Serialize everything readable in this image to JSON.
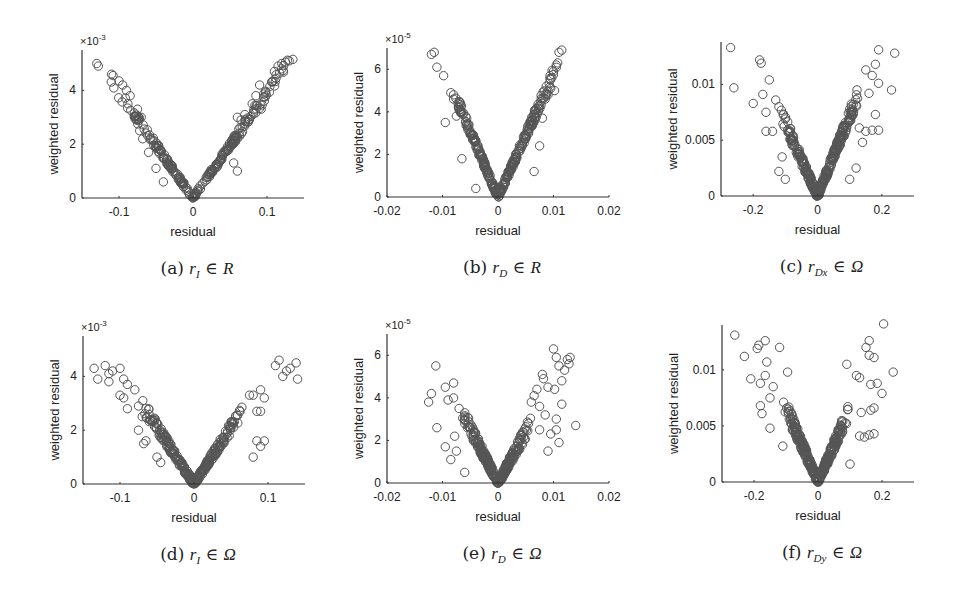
{
  "figure": {
    "marker_color": "#555555",
    "axis_color": "#333333",
    "text_color": "#222222"
  },
  "chart_data": [
    {
      "id": "a",
      "type": "scatter",
      "caption_prefix": "(a)",
      "caption_var": "r",
      "caption_sub": "I",
      "caption_set": "R",
      "xlabel": "residual",
      "ylabel": "weighted residual",
      "y_exponent": "×10",
      "y_exponent_power": "-3",
      "xlim": [
        -0.15,
        0.15
      ],
      "ylim": [
        0,
        5.5
      ],
      "xticks": [
        -0.1,
        0,
        0.1
      ],
      "xtick_labels": [
        "-0.1",
        "0",
        "0.1"
      ],
      "yticks": [
        0,
        2,
        4
      ],
      "ytick_labels": [
        "0",
        "2",
        "4"
      ],
      "box": {
        "left": 82,
        "top": 50,
        "right": 304,
        "bottom": 198
      },
      "band": {
        "slope_left": 39,
        "slope_right": 39,
        "spread": 0.35,
        "xmin": -0.12,
        "xmax": 0.135,
        "n": 260,
        "curve": 0.15
      },
      "points": [
        [
          -0.13,
          5.0
        ],
        [
          -0.128,
          4.9
        ],
        [
          -0.11,
          4.6
        ],
        [
          -0.108,
          4.55
        ],
        [
          -0.1,
          4.35
        ],
        [
          -0.095,
          4.2
        ],
        [
          -0.09,
          4.0
        ],
        [
          -0.085,
          3.8
        ],
        [
          -0.088,
          3.5
        ],
        [
          -0.075,
          3.3
        ],
        [
          -0.07,
          3.0
        ],
        [
          -0.072,
          2.5
        ],
        [
          -0.068,
          2.2
        ],
        [
          -0.06,
          1.7
        ],
        [
          -0.05,
          1.1
        ],
        [
          -0.04,
          0.6
        ],
        [
          0.06,
          3.0
        ],
        [
          0.065,
          2.9
        ],
        [
          0.07,
          3.1
        ],
        [
          0.08,
          3.5
        ],
        [
          0.085,
          3.8
        ],
        [
          0.09,
          4.2
        ],
        [
          0.092,
          3.3
        ],
        [
          0.06,
          1.0
        ],
        [
          0.055,
          1.3
        ],
        [
          0.11,
          4.7
        ],
        [
          0.115,
          4.9
        ],
        [
          0.12,
          5.0
        ],
        [
          0.125,
          5.05
        ],
        [
          0.13,
          5.1
        ],
        [
          0.135,
          5.15
        ]
      ]
    },
    {
      "id": "b",
      "type": "scatter",
      "caption_prefix": "(b)",
      "caption_var": "r",
      "caption_sub": "D",
      "caption_set": "R",
      "xlabel": "residual",
      "ylabel": "weighted residual",
      "y_exponent": "×10",
      "y_exponent_power": "-5",
      "xlim": [
        -0.02,
        0.02
      ],
      "ylim": [
        0,
        7
      ],
      "xticks": [
        -0.02,
        -0.01,
        0,
        0.01,
        0.02
      ],
      "xtick_labels": [
        "-0.02",
        "-0.01",
        "0",
        "0.01",
        "0.02"
      ],
      "yticks": [
        0,
        2,
        4,
        6
      ],
      "ytick_labels": [
        "0",
        "2",
        "4",
        "6"
      ],
      "box": {
        "left": 387,
        "top": 48,
        "right": 609,
        "bottom": 197
      },
      "band": {
        "slope_left": 620,
        "slope_right": 580,
        "spread": 0.5,
        "xmin": -0.0085,
        "xmax": 0.0115,
        "n": 300,
        "curve": 0.1
      },
      "points": [
        [
          -0.012,
          6.7
        ],
        [
          -0.0115,
          6.8
        ],
        [
          -0.011,
          6.1
        ],
        [
          -0.0098,
          5.7
        ],
        [
          -0.0095,
          3.5
        ],
        [
          -0.0085,
          4.9
        ],
        [
          -0.008,
          4.8
        ],
        [
          -0.008,
          4.6
        ],
        [
          -0.0075,
          3.8
        ],
        [
          -0.0065,
          1.8
        ],
        [
          -0.004,
          0.4
        ],
        [
          0.0065,
          1.2
        ],
        [
          0.0075,
          2.4
        ],
        [
          0.008,
          3.7
        ],
        [
          0.0085,
          4.6
        ],
        [
          0.009,
          4.8
        ],
        [
          0.0095,
          5.1
        ],
        [
          0.01,
          5.9
        ],
        [
          0.0105,
          6.2
        ],
        [
          0.011,
          6.8
        ],
        [
          0.0115,
          6.9
        ],
        [
          0.0102,
          5.0
        ]
      ]
    },
    {
      "id": "c",
      "type": "scatter",
      "caption_prefix": "(c)",
      "caption_var": "r",
      "caption_sub": "Dx",
      "caption_set": "Ω",
      "xlabel": "residual",
      "ylabel": "weighted residual",
      "y_exponent": "",
      "y_exponent_power": "",
      "xlim": [
        -0.3,
        0.3
      ],
      "ylim": [
        0,
        0.0138
      ],
      "xticks": [
        -0.2,
        0,
        0.2
      ],
      "xtick_labels": [
        "-0.2",
        "0",
        "0.2"
      ],
      "yticks": [
        0,
        0.005,
        0.01
      ],
      "ytick_labels": [
        "0",
        "0.005",
        "0.01"
      ],
      "box": {
        "left": 721,
        "top": 42,
        "right": 914,
        "bottom": 196
      },
      "band": {
        "slope_left": 0.065,
        "slope_right": 0.072,
        "spread": 0.0012,
        "xmin": -0.12,
        "xmax": 0.14,
        "n": 320,
        "curve": 0.1
      },
      "points": [
        [
          -0.27,
          0.0133
        ],
        [
          -0.26,
          0.0097
        ],
        [
          -0.18,
          0.0122
        ],
        [
          -0.175,
          0.0119
        ],
        [
          -0.15,
          0.0104
        ],
        [
          -0.2,
          0.0083
        ],
        [
          -0.17,
          0.0091
        ],
        [
          -0.16,
          0.0075
        ],
        [
          -0.16,
          0.0058
        ],
        [
          -0.14,
          0.0058
        ],
        [
          -0.13,
          0.0086
        ],
        [
          -0.12,
          0.008
        ],
        [
          -0.11,
          0.0035
        ],
        [
          -0.1,
          0.0015
        ],
        [
          -0.12,
          0.0022
        ],
        [
          0.19,
          0.0131
        ],
        [
          0.24,
          0.0128
        ],
        [
          0.23,
          0.0095
        ],
        [
          0.18,
          0.0118
        ],
        [
          0.17,
          0.0108
        ],
        [
          0.15,
          0.0113
        ],
        [
          0.19,
          0.0101
        ],
        [
          0.16,
          0.0092
        ],
        [
          0.18,
          0.0073
        ],
        [
          0.19,
          0.0059
        ],
        [
          0.17,
          0.0059
        ],
        [
          0.15,
          0.0058
        ],
        [
          0.13,
          0.0061
        ],
        [
          0.14,
          0.0048
        ],
        [
          0.12,
          0.0025
        ],
        [
          0.1,
          0.0015
        ]
      ]
    },
    {
      "id": "d",
      "type": "scatter",
      "caption_prefix": "(d)",
      "caption_var": "r",
      "caption_sub": "I",
      "caption_set": "Ω",
      "xlabel": "residual",
      "ylabel": "weighted residual",
      "y_exponent": "×10",
      "y_exponent_power": "-3",
      "xlim": [
        -0.15,
        0.15
      ],
      "ylim": [
        0,
        5.5
      ],
      "xticks": [
        -0.1,
        0,
        0.1
      ],
      "xtick_labels": [
        "-0.1",
        "0",
        "0.1"
      ],
      "yticks": [
        0,
        2,
        4
      ],
      "ytick_labels": [
        "0",
        "2",
        "4"
      ],
      "box": {
        "left": 83,
        "top": 336,
        "right": 305,
        "bottom": 484
      },
      "band": {
        "slope_left": 42,
        "slope_right": 42,
        "spread": 0.4,
        "xmin": -0.075,
        "xmax": 0.07,
        "n": 280,
        "curve": 0.1
      },
      "points": [
        [
          -0.135,
          4.3
        ],
        [
          -0.13,
          3.9
        ],
        [
          -0.12,
          4.4
        ],
        [
          -0.115,
          4.1
        ],
        [
          -0.11,
          4.2
        ],
        [
          -0.115,
          3.8
        ],
        [
          -0.1,
          4.3
        ],
        [
          -0.095,
          3.9
        ],
        [
          -0.09,
          3.7
        ],
        [
          -0.1,
          3.3
        ],
        [
          -0.095,
          3.2
        ],
        [
          -0.09,
          2.8
        ],
        [
          -0.08,
          3.5
        ],
        [
          -0.075,
          2.9
        ],
        [
          -0.07,
          2.5
        ],
        [
          -0.075,
          2.0
        ],
        [
          -0.068,
          1.5
        ],
        [
          -0.065,
          1.6
        ],
        [
          -0.05,
          1.0
        ],
        [
          -0.045,
          0.8
        ],
        [
          0.075,
          3.3
        ],
        [
          0.08,
          3.3
        ],
        [
          0.09,
          3.5
        ],
        [
          0.095,
          3.2
        ],
        [
          0.085,
          2.7
        ],
        [
          0.09,
          2.7
        ],
        [
          0.08,
          1.0
        ],
        [
          0.09,
          1.4
        ],
        [
          0.095,
          1.6
        ],
        [
          0.085,
          1.6
        ],
        [
          0.11,
          4.4
        ],
        [
          0.115,
          4.6
        ],
        [
          0.12,
          4.0
        ],
        [
          0.125,
          4.2
        ],
        [
          0.13,
          4.3
        ],
        [
          0.138,
          4.5
        ],
        [
          0.14,
          3.9
        ]
      ]
    },
    {
      "id": "e",
      "type": "scatter",
      "caption_prefix": "(e)",
      "caption_var": "r",
      "caption_sub": "D",
      "caption_set": "Ω",
      "xlabel": "residual",
      "ylabel": "weighted residual",
      "y_exponent": "×10",
      "y_exponent_power": "-5",
      "xlim": [
        -0.02,
        0.02
      ],
      "ylim": [
        0,
        7
      ],
      "xticks": [
        -0.02,
        -0.01,
        0,
        0.01,
        0.02
      ],
      "xtick_labels": [
        "-0.02",
        "-0.01",
        "0",
        "0.01",
        "0.02"
      ],
      "yticks": [
        0,
        2,
        4,
        6
      ],
      "ytick_labels": [
        "0",
        "2",
        "4",
        "6"
      ],
      "box": {
        "left": 387,
        "top": 334,
        "right": 609,
        "bottom": 483
      },
      "band": {
        "slope_left": 520,
        "slope_right": 480,
        "spread": 0.6,
        "xmin": -0.007,
        "xmax": 0.006,
        "n": 280,
        "curve": 0.1
      },
      "points": [
        [
          -0.0125,
          3.8
        ],
        [
          -0.012,
          4.2
        ],
        [
          -0.0112,
          5.5
        ],
        [
          -0.011,
          2.6
        ],
        [
          -0.0095,
          1.7
        ],
        [
          -0.0095,
          4.5
        ],
        [
          -0.009,
          3.9
        ],
        [
          -0.0085,
          1.1
        ],
        [
          -0.008,
          4.7
        ],
        [
          -0.008,
          4.0
        ],
        [
          -0.0078,
          2.2
        ],
        [
          -0.0075,
          1.5
        ],
        [
          -0.007,
          3.5
        ],
        [
          -0.006,
          0.5
        ],
        [
          0.006,
          3.8
        ],
        [
          0.0065,
          4.1
        ],
        [
          0.007,
          4.4
        ],
        [
          0.0075,
          3.6
        ],
        [
          0.0075,
          2.5
        ],
        [
          0.008,
          5.1
        ],
        [
          0.0082,
          4.9
        ],
        [
          0.0085,
          3.2
        ],
        [
          0.009,
          4.5
        ],
        [
          0.009,
          1.5
        ],
        [
          0.0095,
          2.3
        ],
        [
          0.01,
          6.3
        ],
        [
          0.0102,
          4.4
        ],
        [
          0.0105,
          5.9
        ],
        [
          0.0105,
          3.0
        ],
        [
          0.011,
          5.5
        ],
        [
          0.011,
          1.9
        ],
        [
          0.0115,
          4.8
        ],
        [
          0.012,
          5.3
        ],
        [
          0.0125,
          5.8
        ],
        [
          0.013,
          5.9
        ],
        [
          0.0128,
          5.6
        ],
        [
          0.0115,
          3.7
        ],
        [
          0.014,
          2.7
        ],
        [
          0.0105,
          2.5
        ]
      ]
    },
    {
      "id": "f",
      "type": "scatter",
      "caption_prefix": "(f)",
      "caption_var": "r",
      "caption_sub": "Dy",
      "caption_set": "Ω",
      "xlabel": "residual",
      "ylabel": "weighted residual",
      "y_exponent": "",
      "y_exponent_power": "",
      "xlim": [
        -0.3,
        0.3
      ],
      "ylim": [
        0,
        0.014
      ],
      "xticks": [
        -0.2,
        0,
        0.2
      ],
      "xtick_labels": [
        "-0.2",
        "0",
        "0.2"
      ],
      "yticks": [
        0,
        0.005,
        0.01
      ],
      "ytick_labels": [
        "0",
        "0.005",
        "0.01"
      ],
      "box": {
        "left": 722,
        "top": 325,
        "right": 914,
        "bottom": 482
      },
      "band": {
        "slope_left": 0.066,
        "slope_right": 0.066,
        "spread": 0.0012,
        "xmin": -0.11,
        "xmax": 0.1,
        "n": 320,
        "curve": 0.1
      },
      "points": [
        [
          -0.26,
          0.0131
        ],
        [
          -0.23,
          0.0112
        ],
        [
          -0.19,
          0.0119
        ],
        [
          -0.185,
          0.0122
        ],
        [
          -0.165,
          0.0126
        ],
        [
          -0.16,
          0.0107
        ],
        [
          -0.12,
          0.012
        ],
        [
          -0.21,
          0.0092
        ],
        [
          -0.165,
          0.0095
        ],
        [
          -0.18,
          0.0088
        ],
        [
          -0.095,
          0.0098
        ],
        [
          -0.14,
          0.0085
        ],
        [
          -0.15,
          0.0075
        ],
        [
          -0.18,
          0.0068
        ],
        [
          -0.175,
          0.0061
        ],
        [
          -0.15,
          0.0048
        ],
        [
          -0.11,
          0.0032
        ],
        [
          0.205,
          0.0141
        ],
        [
          0.16,
          0.0126
        ],
        [
          0.15,
          0.012
        ],
        [
          0.16,
          0.0113
        ],
        [
          0.175,
          0.0111
        ],
        [
          0.235,
          0.0098
        ],
        [
          0.09,
          0.0105
        ],
        [
          0.12,
          0.0095
        ],
        [
          0.13,
          0.0093
        ],
        [
          0.165,
          0.0087
        ],
        [
          0.185,
          0.0088
        ],
        [
          0.2,
          0.0079
        ],
        [
          0.175,
          0.0066
        ],
        [
          0.165,
          0.0064
        ],
        [
          0.135,
          0.0062
        ],
        [
          0.175,
          0.0043
        ],
        [
          0.16,
          0.0042
        ],
        [
          0.145,
          0.004
        ],
        [
          0.13,
          0.0041
        ],
        [
          0.1,
          0.0016
        ]
      ]
    }
  ]
}
